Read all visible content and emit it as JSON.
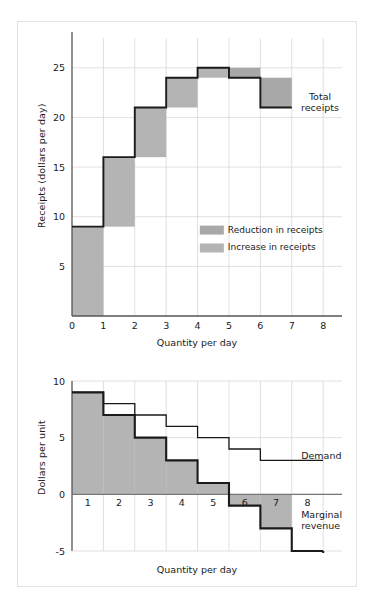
{
  "figure": {
    "background": "#ffffff",
    "frame_color": "#e2e2e2",
    "grid_color": "#d8d8d8",
    "axis_color": "#555555",
    "curve_color": "#1a1a1a",
    "shade_reduction_color": "#a8a8a8",
    "shade_increase_color": "#b4b4b4"
  },
  "top_panel": {
    "ylabel": "Receipts (dollars per day)",
    "xlabel": "Quantity per day",
    "series_label": "Total receipts",
    "legend": [
      {
        "label": "Reduction in receipts",
        "swatch": "#a8a8a8"
      },
      {
        "label": "Increase in receipts",
        "swatch": "#b4b4b4"
      }
    ]
  },
  "bottom_panel": {
    "ylabel": "Dollars per unit",
    "xlabel": "Quantity per day",
    "demand_label": "Demand",
    "mr_label_line1": "Marginal",
    "mr_label_line2": "revenue"
  },
  "chart_data": [
    {
      "type": "bar",
      "title": "Total receipts",
      "xlabel": "Quantity per day",
      "ylabel": "Receipts (dollars per day)",
      "xlim": [
        0,
        8.6
      ],
      "ylim": [
        0,
        28
      ],
      "xticks": [
        0,
        1,
        2,
        3,
        4,
        5,
        6,
        7,
        8
      ],
      "xtick_labels": [
        "0",
        "1",
        "2",
        "3",
        "4",
        "5",
        "6",
        "7",
        "8"
      ],
      "yticks": [
        5,
        10,
        15,
        20,
        25
      ],
      "ytick_labels": [
        "5",
        "10",
        "15",
        "20",
        "25"
      ],
      "grid": true,
      "legend_position": "inside-lower-right",
      "categories": [
        1,
        2,
        3,
        4,
        5,
        6,
        7
      ],
      "values": [
        9,
        16,
        21,
        24,
        25,
        24,
        21
      ],
      "step_changes": [
        9,
        7,
        5,
        3,
        1,
        -1,
        -3
      ],
      "shading": [
        {
          "quantity": 1,
          "kind": "increase",
          "from": 0,
          "to": 9
        },
        {
          "quantity": 2,
          "kind": "increase",
          "from": 9,
          "to": 16
        },
        {
          "quantity": 3,
          "kind": "increase",
          "from": 16,
          "to": 21
        },
        {
          "quantity": 4,
          "kind": "increase",
          "from": 21,
          "to": 24
        },
        {
          "quantity": 5,
          "kind": "increase",
          "from": 24,
          "to": 25
        },
        {
          "quantity": 6,
          "kind": "reduction",
          "from": 24,
          "to": 25
        },
        {
          "quantity": 7,
          "kind": "reduction",
          "from": 21,
          "to": 24
        }
      ],
      "annotations": [
        {
          "text": "Total receipts",
          "x": 7.9,
          "y": 21.8
        },
        {
          "text": "Reduction in receipts",
          "x": 4.9,
          "y": 8.4
        },
        {
          "text": "Increase in receipts",
          "x": 4.9,
          "y": 6.6
        }
      ]
    },
    {
      "type": "line",
      "title": "Demand and Marginal revenue",
      "xlabel": "Quantity per day",
      "ylabel": "Dollars per unit",
      "xlim": [
        0,
        8.6
      ],
      "ylim": [
        -5,
        10
      ],
      "xticks": [
        1,
        2,
        3,
        4,
        5,
        6,
        7,
        8
      ],
      "xtick_labels": [
        "1",
        "2",
        "3",
        "4",
        "5",
        "6",
        "7",
        "8"
      ],
      "yticks": [
        -5,
        0,
        5,
        10
      ],
      "ytick_labels": [
        "-5",
        "0",
        "5",
        "10"
      ],
      "grid": true,
      "categories": [
        1,
        2,
        3,
        4,
        5,
        6,
        7,
        8
      ],
      "series": [
        {
          "name": "Demand",
          "values": [
            9,
            8,
            7,
            6,
            5,
            4,
            3,
            3
          ]
        },
        {
          "name": "Marginal revenue",
          "values": [
            9,
            7,
            5,
            3,
            1,
            -1,
            -3,
            -5
          ]
        }
      ],
      "shade_under_mr": true,
      "annotations": [
        {
          "text": "Demand",
          "x": 7.3,
          "y": 3.1
        },
        {
          "text": "Marginal",
          "x": 7.3,
          "y": -2.1
        },
        {
          "text": "revenue",
          "x": 7.3,
          "y": -3.1
        }
      ]
    }
  ]
}
